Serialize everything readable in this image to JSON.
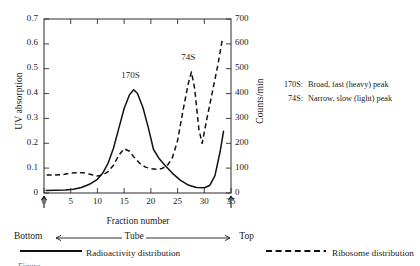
{
  "figure": {
    "alt_name": "sucrose-gradient-sedimentation-profile"
  },
  "axes": {
    "y_left_title": "UV absorption",
    "y_right_title": "Counts/min",
    "x_title": "Fraction number"
  },
  "gradient_row": {
    "bottom_label": "Bottom",
    "middle_label": "Tube",
    "top_label": "Top"
  },
  "peak_labels": [
    {
      "text": "170S"
    },
    {
      "text": "74S"
    }
  ],
  "notes": [
    {
      "key": "170S:",
      "text": "Broad, fast (heavy) peak"
    },
    {
      "key": "74S:",
      "text": "Narrow, slow (light) peak"
    }
  ],
  "legend": {
    "radioactivity": "Radioactivity distribution",
    "ribosome": "Ribosome distribution"
  },
  "caption": "Figure",
  "colors": {
    "ink": "#1a1a1a",
    "frame": "#2b2b2b",
    "paper": "#ffffff"
  },
  "chart_data": {
    "type": "line",
    "title": "",
    "xlabel": "Fraction number",
    "ylabel": "UV absorption",
    "y2label": "Counts/min",
    "xlim": [
      0,
      35
    ],
    "ylim": [
      0,
      0.7
    ],
    "y2lim": [
      0,
      700
    ],
    "xticks": [
      0,
      5,
      10,
      15,
      20,
      25,
      30,
      35
    ],
    "yticks": [
      0,
      0.1,
      0.2,
      0.3,
      0.4,
      0.5,
      0.6,
      0.7
    ],
    "y2ticks": [
      0,
      100,
      200,
      300,
      400,
      500,
      600,
      700
    ],
    "grid": false,
    "legend_position": "below-axes",
    "annotations": [
      {
        "text": "170S",
        "x": 16.2,
        "y": 0.47
      },
      {
        "text": "74S",
        "x": 27.0,
        "y": 0.545
      }
    ],
    "series": [
      {
        "name": "Radioactivity distribution",
        "style": "solid",
        "axis": "left",
        "units": "UV absorption",
        "x": [
          0.4,
          2,
          4,
          5.5,
          7,
          8.5,
          10,
          11,
          12,
          13,
          14,
          15,
          16,
          16.8,
          17.5,
          18.5,
          19.5,
          20.5,
          21.5,
          22.5,
          24,
          25.5,
          27,
          28.5,
          30,
          31,
          32,
          33,
          33.6
        ],
        "y": [
          0.01,
          0.011,
          0.012,
          0.015,
          0.022,
          0.035,
          0.055,
          0.08,
          0.12,
          0.18,
          0.26,
          0.34,
          0.395,
          0.415,
          0.4,
          0.345,
          0.265,
          0.175,
          0.14,
          0.115,
          0.08,
          0.052,
          0.032,
          0.022,
          0.021,
          0.03,
          0.07,
          0.17,
          0.248
        ]
      },
      {
        "name": "Ribosome distribution",
        "style": "dashed",
        "axis": "right",
        "units": "Counts/min",
        "x": [
          0.5,
          2,
          3.5,
          5,
          6.5,
          7.5,
          9,
          10,
          11,
          12,
          13,
          14,
          15,
          16,
          17,
          18,
          19,
          20,
          21,
          22,
          23,
          24,
          25,
          26,
          27,
          27.6,
          28.2,
          29,
          29.6,
          30.5,
          31.5,
          32.5,
          33.4
        ],
        "y": [
          72,
          72,
          74,
          80,
          82,
          81,
          73,
          68,
          72,
          86,
          112,
          152,
          178,
          168,
          140,
          118,
          104,
          98,
          96,
          98,
          108,
          140,
          210,
          330,
          440,
          487,
          420,
          255,
          200,
          300,
          405,
          510,
          620
        ]
      }
    ]
  }
}
